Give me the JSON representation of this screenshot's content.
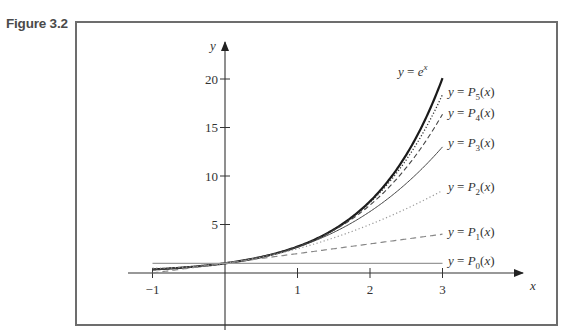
{
  "figure": {
    "label": "Figure 3.2"
  },
  "chart_data": {
    "type": "line",
    "title": "",
    "xlabel": "x",
    "ylabel": "y",
    "xlim": [
      -1,
      3
    ],
    "ylim": [
      0,
      21
    ],
    "grid": false,
    "x_ticks": [
      "-1",
      "1",
      "2",
      "3"
    ],
    "y_ticks": [
      "5",
      "10",
      "15",
      "20"
    ],
    "legend_position": "inline-right",
    "series": [
      {
        "name": "y = e^x",
        "label_parts": {
          "lhs": "y = e",
          "sup": "x"
        },
        "style": "solid-thick",
        "values_at_x": {
          "-1": 0.368,
          "0": 1,
          "1": 2.718,
          "2": 7.389,
          "3": 20.086
        }
      },
      {
        "name": "y = P5(x)",
        "label_parts": {
          "lhs": "y = P",
          "sub": "5",
          "rhs": "(x)"
        },
        "style": "dotted-dense",
        "values_at_x": {
          "-1": 0.367,
          "0": 1,
          "1": 2.717,
          "2": 7.267,
          "3": 18.4
        }
      },
      {
        "name": "y = P4(x)",
        "label_parts": {
          "lhs": "y = P",
          "sub": "4",
          "rhs": "(x)"
        },
        "style": "dashed",
        "values_at_x": {
          "-1": 0.375,
          "0": 1,
          "1": 2.708,
          "2": 7.0,
          "3": 16.375
        }
      },
      {
        "name": "y = P3(x)",
        "label_parts": {
          "lhs": "y = P",
          "sub": "3",
          "rhs": "(x)"
        },
        "style": "solid-thin",
        "values_at_x": {
          "-1": 0.333,
          "0": 1,
          "1": 2.667,
          "2": 6.333,
          "3": 13.0
        }
      },
      {
        "name": "y = P2(x)",
        "label_parts": {
          "lhs": "y = P",
          "sub": "2",
          "rhs": "(x)"
        },
        "style": "dotted-light",
        "values_at_x": {
          "-1": 0.5,
          "0": 1,
          "1": 2.5,
          "2": 5.0,
          "3": 8.5
        }
      },
      {
        "name": "y = P1(x)",
        "label_parts": {
          "lhs": "y = P",
          "sub": "1",
          "rhs": "(x)"
        },
        "style": "dashed-light",
        "values_at_x": {
          "-1": 0,
          "0": 1,
          "1": 2,
          "2": 3,
          "3": 4
        }
      },
      {
        "name": "y = P0(x)",
        "label_parts": {
          "lhs": "y = P",
          "sub": "0",
          "rhs": "(x)"
        },
        "style": "solid-light",
        "values_at_x": {
          "-1": 1,
          "0": 1,
          "1": 1,
          "2": 1,
          "3": 1
        }
      }
    ],
    "annotations": []
  }
}
